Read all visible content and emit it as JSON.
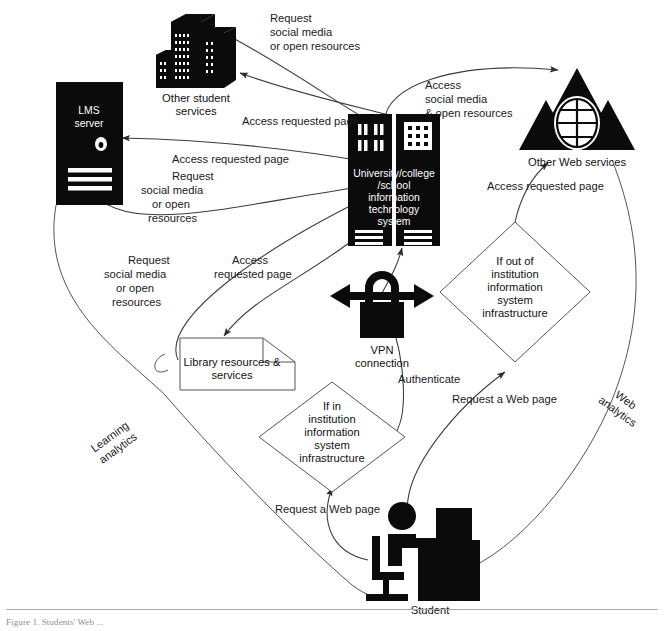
{
  "figure": {
    "caption": "Figure 1. Students' Web ..."
  },
  "nodes": {
    "lms_server": {
      "line1": "LMS",
      "line2": "server",
      "icon": "server-tower-icon"
    },
    "other_student_services": {
      "line1": "Other student",
      "line2": "services",
      "icon": "office-buildings-icon"
    },
    "it_system": {
      "line1": "University/college",
      "line2": "/school",
      "line3": "information",
      "line4": "technology",
      "line5": "system",
      "icon": "server-rack-icon"
    },
    "other_web_services": {
      "label": "Other Web services",
      "icon": "web-triangles-globe-icon"
    },
    "library": {
      "line1": "Library resources &",
      "line2": "services",
      "icon": "document-shape-icon"
    },
    "vpn": {
      "line1": "VPN",
      "line2": "connection",
      "icon": "padlock-arrows-icon"
    },
    "student": {
      "label": "Student",
      "icon": "student-at-desk-icon"
    },
    "decision_out": {
      "line1": "If out of",
      "line2": "institution",
      "line3": "information",
      "line4": "system",
      "line5": "infrastructure"
    },
    "decision_in": {
      "line1": "If in",
      "line2": "institution",
      "line3": "information",
      "line4": "system",
      "line5": "infrastructure"
    }
  },
  "edge_labels": {
    "request_social_top": {
      "line1": "Request",
      "line2": "social media",
      "line3": "or open resources"
    },
    "access_requested_page_top": {
      "text": "Access requested page"
    },
    "access_requested_page_lms": {
      "text": "Access requested page"
    },
    "request_social_lms": {
      "line1": "Request",
      "line2": "social media",
      "line3": "or open",
      "line4": "resources"
    },
    "access_social_open": {
      "line1": "Access",
      "line2": "social media",
      "line3": "& open resources"
    },
    "access_requested_page_web": {
      "text": "Access requested page"
    },
    "request_social_library": {
      "line1": "Request",
      "line2": "social media",
      "line3": "or open",
      "line4": "resources"
    },
    "access_requested_page_library": {
      "line1": "Access",
      "line2": "requested page"
    },
    "authenticate": {
      "text": "Authenticate"
    },
    "request_web_page_mid": {
      "text": "Request a Web page"
    },
    "request_web_page_left": {
      "text": "Request a Web page"
    },
    "learning_analytics": {
      "line1": "Learning",
      "line2": "analytics"
    },
    "web_analytics": {
      "line1": "Web",
      "line2": "analytics"
    }
  },
  "colors": {
    "ink": "#0b0b0b",
    "line": "#3a3a3a",
    "paper": "#ffffff",
    "shape_stroke": "#555555"
  }
}
